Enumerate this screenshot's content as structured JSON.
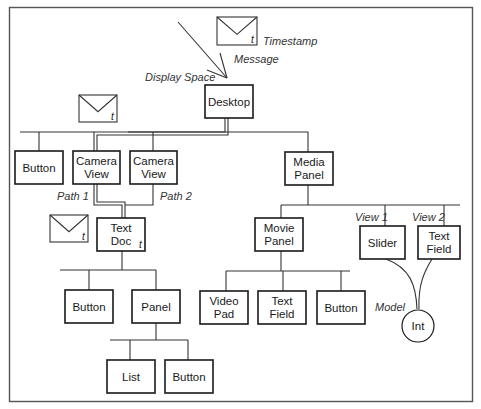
{
  "diagram": {
    "title": "Display Space",
    "colors": {
      "line": "#333333",
      "box_stroke": "#1a1a1a",
      "frame": "#555555",
      "background": "#ffffff"
    },
    "annotations": [
      {
        "id": "display-space",
        "text": "Display Space",
        "x": 145,
        "y": 81
      },
      {
        "id": "message",
        "text": "Message",
        "x": 234,
        "y": 63
      },
      {
        "id": "timestamp",
        "text": "Timestamp",
        "x": 263,
        "y": 45
      },
      {
        "id": "path-1",
        "text": "Path 1",
        "x": 57,
        "y": 200
      },
      {
        "id": "path-2",
        "text": "Path 2",
        "x": 160,
        "y": 200
      },
      {
        "id": "view-1",
        "text": "View 1",
        "x": 355,
        "y": 221
      },
      {
        "id": "view-2",
        "text": "View 2",
        "x": 412,
        "y": 221
      },
      {
        "id": "model",
        "text": "Model",
        "x": 375,
        "y": 311
      }
    ],
    "nodes": [
      {
        "id": "desktop",
        "lines": [
          "Desktop"
        ],
        "x": 205,
        "y": 85,
        "w": 48,
        "h": 33
      },
      {
        "id": "button-1",
        "lines": [
          "Button"
        ],
        "x": 15,
        "y": 151,
        "w": 48,
        "h": 33
      },
      {
        "id": "camera-view-1",
        "lines": [
          "Camera",
          "View"
        ],
        "x": 73,
        "y": 151,
        "w": 47,
        "h": 33
      },
      {
        "id": "camera-view-2",
        "lines": [
          "Camera",
          "View"
        ],
        "x": 130,
        "y": 151,
        "w": 47,
        "h": 33
      },
      {
        "id": "media-panel",
        "lines": [
          "Media",
          "Panel"
        ],
        "x": 285,
        "y": 152,
        "w": 48,
        "h": 33
      },
      {
        "id": "text-doc",
        "lines": [
          "Text",
          "Doc"
        ],
        "x": 97,
        "y": 218,
        "w": 48,
        "h": 33,
        "timestamp": "t"
      },
      {
        "id": "movie-panel",
        "lines": [
          "Movie",
          "Panel"
        ],
        "x": 255,
        "y": 218,
        "w": 48,
        "h": 33
      },
      {
        "id": "slider",
        "lines": [
          "Slider"
        ],
        "x": 360,
        "y": 226,
        "w": 45,
        "h": 33
      },
      {
        "id": "text-field-1",
        "lines": [
          "Text",
          "Field"
        ],
        "x": 418,
        "y": 226,
        "w": 42,
        "h": 33
      },
      {
        "id": "button-2",
        "lines": [
          "Button"
        ],
        "x": 65,
        "y": 290,
        "w": 48,
        "h": 33
      },
      {
        "id": "panel",
        "lines": [
          "Panel"
        ],
        "x": 132,
        "y": 290,
        "w": 48,
        "h": 33
      },
      {
        "id": "video-pad",
        "lines": [
          "Video",
          "Pad"
        ],
        "x": 200,
        "y": 291,
        "w": 48,
        "h": 33
      },
      {
        "id": "text-field-2",
        "lines": [
          "Text",
          "Field"
        ],
        "x": 258,
        "y": 291,
        "w": 48,
        "h": 33
      },
      {
        "id": "button-3",
        "lines": [
          "Button"
        ],
        "x": 317,
        "y": 291,
        "w": 48,
        "h": 33
      },
      {
        "id": "list",
        "lines": [
          "List"
        ],
        "x": 107,
        "y": 360,
        "w": 48,
        "h": 33
      },
      {
        "id": "button-4",
        "lines": [
          "Button"
        ],
        "x": 165,
        "y": 360,
        "w": 48,
        "h": 33
      }
    ],
    "model_node": {
      "id": "int",
      "label": "Int",
      "cx": 418,
      "cy": 326,
      "r": 16
    },
    "envelopes": [
      {
        "id": "envelope-top",
        "x": 217,
        "y": 17,
        "w": 40,
        "h": 28,
        "t": "t"
      },
      {
        "id": "envelope-left",
        "x": 79,
        "y": 95,
        "w": 38,
        "h": 27,
        "t": "t"
      },
      {
        "id": "envelope-mid",
        "x": 50,
        "y": 215,
        "w": 38,
        "h": 27,
        "t": "t"
      }
    ]
  }
}
